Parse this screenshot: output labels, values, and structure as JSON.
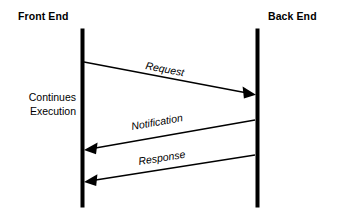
{
  "diagram": {
    "title_left": "Front End",
    "title_right": "Back End",
    "note": {
      "line1": "Continues",
      "line2": "Execution"
    },
    "messages": {
      "request": "Request",
      "notification": "Notification",
      "response": "Response"
    },
    "colors": {
      "background": "#ffffff",
      "ink": "#000000"
    }
  }
}
